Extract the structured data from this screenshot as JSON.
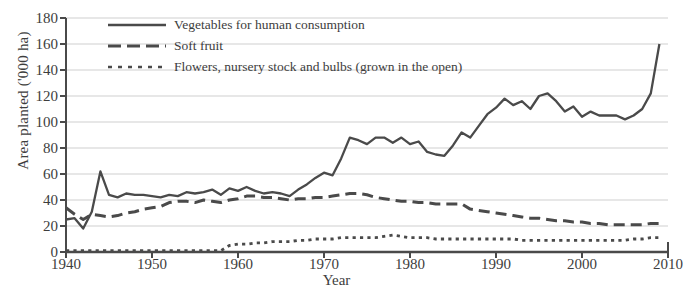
{
  "chart_data": {
    "type": "line",
    "title": "",
    "xlabel": "Year",
    "ylabel": "Area planted ('000 ha)",
    "xlim": [
      1940,
      2010
    ],
    "ylim": [
      0,
      180
    ],
    "yticks": [
      0,
      20,
      40,
      60,
      80,
      100,
      120,
      140,
      160,
      180
    ],
    "xticks": [
      1940,
      1950,
      1960,
      1970,
      1980,
      1990,
      2000,
      2010
    ],
    "grid": "horizontal",
    "legend_position": "top-left-inside",
    "line_color": "#4a4a4a",
    "grid_color": "#cfcfcf",
    "axis_color": "#4a4a4a",
    "x": [
      1940,
      1941,
      1942,
      1943,
      1944,
      1945,
      1946,
      1947,
      1948,
      1949,
      1950,
      1951,
      1952,
      1953,
      1954,
      1955,
      1956,
      1957,
      1958,
      1959,
      1960,
      1961,
      1962,
      1963,
      1964,
      1965,
      1966,
      1967,
      1968,
      1969,
      1970,
      1971,
      1972,
      1973,
      1974,
      1975,
      1976,
      1977,
      1978,
      1979,
      1980,
      1981,
      1982,
      1983,
      1984,
      1985,
      1986,
      1987,
      1988,
      1989,
      1990,
      1991,
      1992,
      1993,
      1994,
      1995,
      1996,
      1997,
      1998,
      1999,
      2000,
      2001,
      2002,
      2003,
      2004,
      2005,
      2006,
      2007,
      2008,
      2009
    ],
    "series": [
      {
        "name": "Vegetables for human consumption",
        "style": "solid",
        "values": [
          25,
          26,
          18,
          31,
          62,
          44,
          42,
          45,
          44,
          44,
          43,
          42,
          44,
          43,
          46,
          45,
          46,
          48,
          44,
          49,
          47,
          50,
          47,
          45,
          46,
          45,
          43,
          48,
          52,
          57,
          61,
          59,
          72,
          88,
          86,
          83,
          88,
          88,
          84,
          88,
          83,
          85,
          77,
          75,
          74,
          82,
          92,
          88,
          97,
          106,
          111,
          118,
          113,
          116,
          110,
          120,
          122,
          116,
          108,
          112,
          104,
          108,
          105,
          105,
          105,
          102,
          105,
          110,
          122,
          160
        ]
      },
      {
        "name": "Soft fruit",
        "style": "dashed",
        "values": [
          34,
          29,
          25,
          29,
          28,
          27,
          28,
          30,
          31,
          33,
          34,
          35,
          38,
          39,
          39,
          38,
          40,
          39,
          38,
          40,
          41,
          43,
          43,
          42,
          42,
          41,
          40,
          41,
          41,
          42,
          42,
          43,
          44,
          45,
          45,
          44,
          42,
          41,
          40,
          39,
          39,
          38,
          38,
          37,
          37,
          37,
          37,
          33,
          32,
          31,
          30,
          29,
          28,
          27,
          26,
          26,
          25,
          24,
          24,
          23,
          23,
          22,
          22,
          21,
          21,
          21,
          21,
          21,
          22,
          22
        ]
      },
      {
        "name": "Flowers, nursery stock and bulbs (grown in the open)",
        "style": "dotted",
        "values": [
          1,
          1,
          1,
          1,
          1,
          1,
          1,
          1,
          1,
          1,
          1,
          1,
          1,
          1,
          1,
          1,
          1,
          1,
          1,
          5,
          6,
          6,
          7,
          7,
          8,
          8,
          8,
          9,
          9,
          10,
          10,
          10,
          11,
          11,
          11,
          11,
          11,
          12,
          13,
          12,
          11,
          11,
          11,
          10,
          10,
          10,
          10,
          10,
          10,
          10,
          10,
          10,
          10,
          9,
          9,
          9,
          9,
          9,
          9,
          9,
          9,
          9,
          9,
          9,
          9,
          9,
          10,
          10,
          11,
          11
        ]
      }
    ]
  },
  "legend": {
    "items": [
      {
        "label": "Vegetables for human consumption"
      },
      {
        "label": "Soft fruit"
      },
      {
        "label": "Flowers, nursery stock and bulbs (grown in the open)"
      }
    ]
  }
}
